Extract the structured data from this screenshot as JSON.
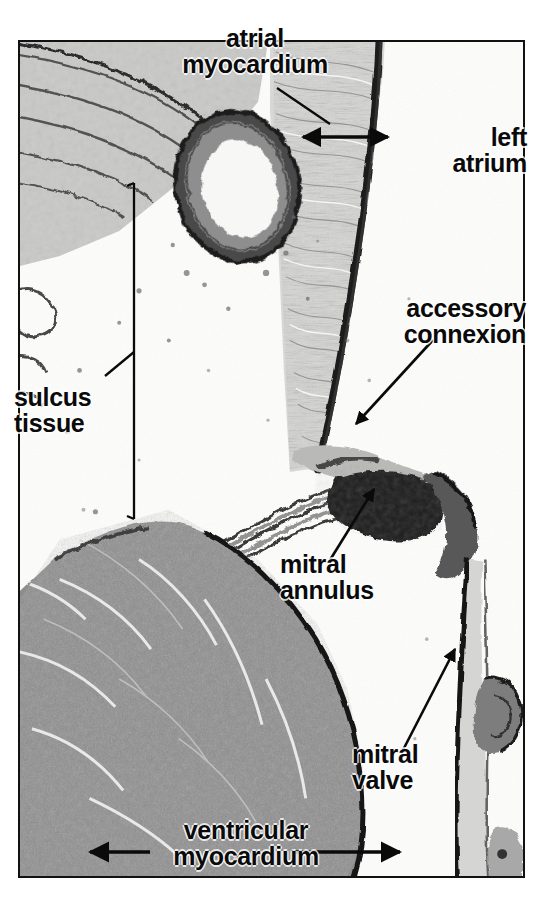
{
  "figure": {
    "kind": "histology-micrograph",
    "stain_tone": "#6d6d6d",
    "frame_color": "#111111",
    "background_color": "#ffffff"
  },
  "labels": {
    "atrial_myocardium": "atrial\nmyocardium",
    "left_atrium": "left\natrium",
    "accessory_connexion": "accessory\nconnexion",
    "sulcus_tissue": "sulcus\ntissue",
    "mitral_annulus": "mitral\nannulus",
    "mitral_valve": "mitral\nvalve",
    "ventricular_myocardium": "ventricular\nmyocardium"
  },
  "annotations": {
    "atrial_myocardium_leader": "diagonal-leader-line",
    "atrial_myocardium_span": "double-headed-arrow",
    "accessory_connexion_arrow": "diagonal-arrow",
    "sulcus_tissue_bracket": "vertical-bracket",
    "mitral_annulus_arrow": "diagonal-arrow",
    "mitral_valve_arrow": "diagonal-arrow",
    "ventricular_myocardium_span": "double-headed-arrow"
  },
  "structures": [
    {
      "name": "coronary-artery",
      "description": "thick-walled artery cross-section in sulcus"
    },
    {
      "name": "atrial-myocardial-wall",
      "description": "striated atrial wall at upper right"
    },
    {
      "name": "left-atrial-cavity",
      "description": "open chamber at right"
    },
    {
      "name": "sulcus-fat-tissue",
      "description": "pale tissue at left of annulus"
    },
    {
      "name": "mitral-annulus-body",
      "description": "dense dark fibrous mass"
    },
    {
      "name": "mitral-valve-leaflet",
      "description": "thin dark leaflet descending at right"
    },
    {
      "name": "ventricular-myocardial-mass",
      "description": "large gray muscle block lower left"
    }
  ]
}
